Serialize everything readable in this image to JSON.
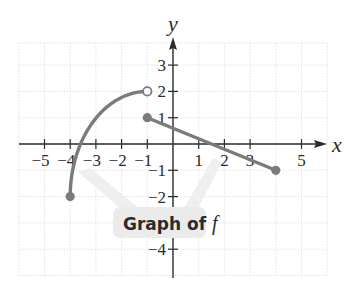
{
  "chart_data": {
    "type": "line",
    "title": "",
    "xlabel": "x",
    "ylabel": "y",
    "xlim": [
      -6,
      6
    ],
    "ylim": [
      -5,
      4
    ],
    "grid": true,
    "x_ticks": [
      -5,
      -4,
      -3,
      -2,
      -1,
      1,
      2,
      3,
      5
    ],
    "x_tick_labels": [
      "−5",
      "−4",
      "−3",
      "−2",
      "−1",
      "1",
      "2",
      "3",
      "5"
    ],
    "y_ticks": [
      3,
      2,
      1,
      -1,
      -2,
      -4
    ],
    "y_tick_labels": [
      "3",
      "2",
      "1",
      "−1",
      "−2",
      "−4"
    ],
    "series": [
      {
        "name": "curve piece",
        "shape": "quarter-ellipse arc, concave down",
        "domain": [
          -4,
          -1
        ],
        "start": {
          "x": -4,
          "y": -2,
          "endpoint": "closed"
        },
        "end": {
          "x": -1,
          "y": 2,
          "endpoint": "open"
        },
        "x_intercept_approx": -3.5
      },
      {
        "name": "line piece",
        "shape": "line segment",
        "domain": [
          -1,
          4
        ],
        "start": {
          "x": -1,
          "y": 1,
          "endpoint": "closed"
        },
        "end": {
          "x": 4,
          "y": -1,
          "endpoint": "closed"
        },
        "slope": -0.4,
        "x_intercept": 1.5
      }
    ],
    "annotations": [
      {
        "text": "Graph of f",
        "points_to": [
          "curve piece",
          "line piece"
        ]
      }
    ]
  },
  "labels": {
    "x_axis": "x",
    "y_axis": "y",
    "callout_main": "Graph of ",
    "callout_italic": "f"
  },
  "colors": {
    "graph": "#7b7b7b",
    "axis": "#2b2b2b",
    "grid": "#e4e4e4",
    "callout_bg": "#ececec",
    "pointer": "#f1f1f1"
  }
}
